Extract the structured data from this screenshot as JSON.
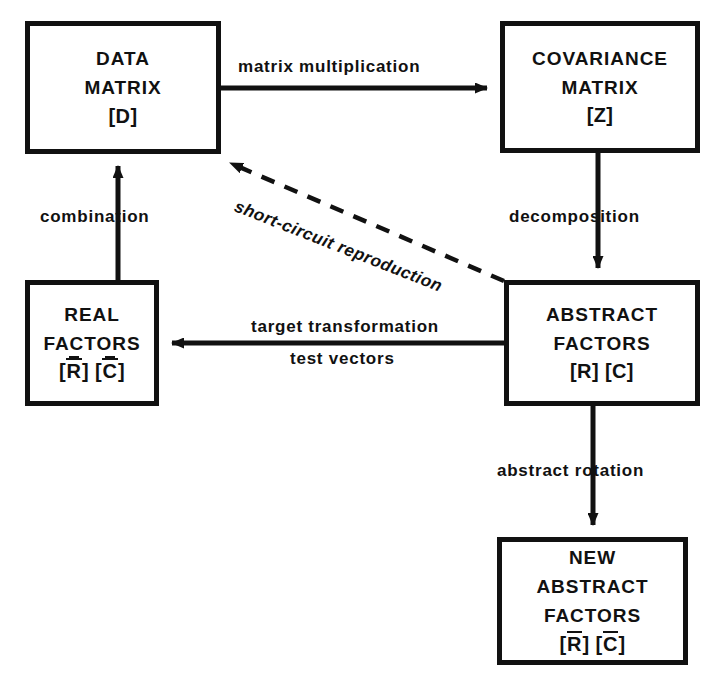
{
  "diagram": {
    "background_color": "#ffffff",
    "line_color": "#111111",
    "nodes": [
      {
        "id": "data-matrix",
        "lines": [
          "DATA",
          "MATRIX"
        ],
        "symbol": "[D]",
        "line1": "DATA",
        "line2": "MATRIX"
      },
      {
        "id": "covariance-matrix",
        "lines": [
          "COVARIANCE",
          "MATRIX"
        ],
        "symbol": "[Z]",
        "line1": "COVARIANCE",
        "line2": "MATRIX"
      },
      {
        "id": "real-factors",
        "lines": [
          "REAL",
          "FACTORS"
        ],
        "symbol": "[R̿] [C̿]",
        "line1": "REAL",
        "line2": "FACTORS",
        "sym_open1": "[",
        "sym_r": "R",
        "sym_close1": "]",
        "sym_open2": "[",
        "sym_c": "C",
        "sym_close2": "]"
      },
      {
        "id": "abstract-factors",
        "lines": [
          "ABSTRACT",
          "FACTORS"
        ],
        "symbol": "[R] [C]",
        "line1": "ABSTRACT",
        "line2": "FACTORS"
      },
      {
        "id": "new-abstract-factors",
        "lines": [
          "NEW",
          "ABSTRACT",
          "FACTORS"
        ],
        "symbol": "[R̄] [C̄]",
        "line1": "NEW",
        "line2": "ABSTRACT",
        "line3": "FACTORS",
        "sym_open1": "[",
        "sym_r": "R",
        "sym_close1": "]",
        "sym_open2": "[",
        "sym_c": "C",
        "sym_close2": "]"
      }
    ],
    "edges": [
      {
        "id": "matrix-multiplication",
        "label": "matrix multiplication",
        "from": "data-matrix",
        "to": "covariance-matrix",
        "style": "solid",
        "direction": "right"
      },
      {
        "id": "decomposition",
        "label": "decomposition",
        "from": "covariance-matrix",
        "to": "abstract-factors",
        "style": "solid",
        "direction": "down"
      },
      {
        "id": "target-transformation",
        "label": "target transformation",
        "label2": "test vectors",
        "from": "abstract-factors",
        "to": "real-factors",
        "style": "solid",
        "direction": "left"
      },
      {
        "id": "combination",
        "label": "combination",
        "from": "real-factors",
        "to": "data-matrix",
        "style": "solid",
        "direction": "up"
      },
      {
        "id": "abstract-rotation",
        "label": "abstract rotation",
        "from": "abstract-factors",
        "to": "new-abstract-factors",
        "style": "solid",
        "direction": "down"
      },
      {
        "id": "short-circuit-reproduction",
        "label": "short-circuit reproduction",
        "from": "abstract-factors",
        "to": "data-matrix",
        "style": "dashed",
        "direction": "up-left"
      }
    ]
  }
}
